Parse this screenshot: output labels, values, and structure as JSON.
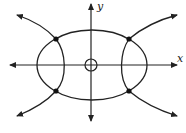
{
  "diagram": {
    "axes": {
      "x_label": "x",
      "y_label": "y"
    },
    "curves": [
      {
        "type": "ellipse",
        "description": "horizontal ellipse centered at origin"
      },
      {
        "type": "hyperbola",
        "description": "hyperbola opening left and right, four arrowed branches"
      },
      {
        "type": "circle",
        "description": "small open circle at origin"
      }
    ],
    "intersection_points": 4,
    "caption": ""
  }
}
